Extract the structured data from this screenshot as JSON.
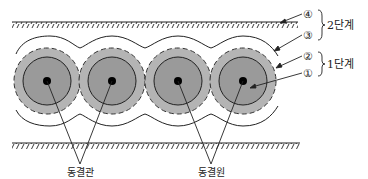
{
  "diagram": {
    "type": "cross-section",
    "colors": {
      "line": "#222222",
      "frozen_outer": "#b4b4b4",
      "frozen_inner": "#9a9a9a",
      "pipe": "#000000",
      "background": "#ffffff"
    },
    "ground_lines": {
      "top": {
        "y": 22,
        "x1": 12,
        "x2": 298
      },
      "bottom": {
        "y": 143,
        "x1": 12,
        "x2": 300
      }
    },
    "pipes": [
      {
        "cx": 47,
        "cy": 81
      },
      {
        "cx": 112,
        "cy": 81
      },
      {
        "cx": 178,
        "cy": 81
      },
      {
        "cx": 243,
        "cy": 81
      }
    ],
    "callouts": [
      {
        "num": "④",
        "label_id": "4",
        "x": 309,
        "y": 17
      },
      {
        "num": "③",
        "label_id": "3",
        "x": 309,
        "y": 37
      },
      {
        "num": "②",
        "label_id": "2",
        "x": 309,
        "y": 58
      },
      {
        "num": "①",
        "label_id": "1",
        "x": 309,
        "y": 75
      }
    ],
    "stages": [
      {
        "label": "2단계",
        "covers": [
          "④",
          "③"
        ]
      },
      {
        "label": "1단계",
        "covers": [
          "②",
          "①"
        ]
      }
    ],
    "bottom_labels": [
      {
        "text": "동결관"
      },
      {
        "text": "동결원"
      }
    ]
  }
}
